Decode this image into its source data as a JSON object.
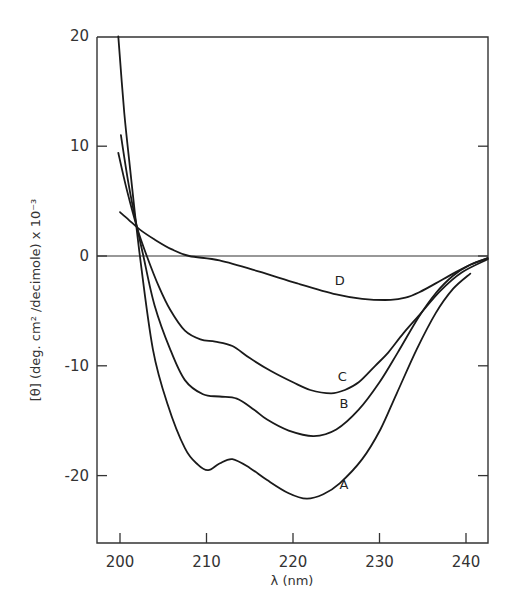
{
  "chart_data": {
    "type": "line",
    "title": "",
    "xlabel": "λ (nm)",
    "ylabel": "[θ] (deg. cm² /decimole) x 10⁻³",
    "xlim": [
      197.3,
      242.5
    ],
    "ylim": [
      -26,
      20
    ],
    "xticks": [
      200,
      210,
      220,
      230,
      240
    ],
    "yticks": [
      20,
      10,
      0,
      -10,
      -20
    ],
    "xtick_labels": [
      "200",
      "210",
      "220",
      "230",
      "240"
    ],
    "ytick_labels": [
      "20",
      "10",
      "0",
      "-10",
      "-20"
    ],
    "grid": false,
    "zero_line": true,
    "legend": "inline labels",
    "series": [
      {
        "name": "A",
        "label_pos": [
          225.9,
          -21.2
        ],
        "x": [
          199.8,
          200.5,
          201.3,
          202.3,
          203.8,
          205.5,
          207.5,
          209.0,
          210.2,
          211.5,
          213.0,
          215.0,
          217.0,
          219.5,
          221.6,
          223.5,
          225.4,
          228.0,
          230.1,
          232.0,
          234.3,
          236.5,
          238.5,
          240.5
        ],
        "y": [
          20.0,
          13.0,
          7.0,
          0.0,
          -8.5,
          -13.5,
          -17.5,
          -19.0,
          -19.5,
          -18.9,
          -18.5,
          -19.3,
          -20.4,
          -21.6,
          -22.1,
          -21.7,
          -20.7,
          -18.5,
          -15.8,
          -12.5,
          -8.5,
          -5.2,
          -3.0,
          -1.6
        ]
      },
      {
        "name": "B",
        "label_pos": [
          225.9,
          -13.8
        ],
        "x": [
          200.1,
          201.0,
          202.0,
          202.7,
          204.0,
          205.8,
          207.5,
          209.6,
          211.5,
          213.5,
          215.5,
          217.0,
          219.5,
          222.4,
          225.0,
          227.6,
          230.0,
          232.1,
          234.5,
          236.5,
          238.5,
          240.5,
          242.5
        ],
        "y": [
          11.0,
          6.5,
          2.5,
          0.0,
          -4.5,
          -8.5,
          -11.3,
          -12.6,
          -12.8,
          -13.0,
          -14.0,
          -14.9,
          -15.9,
          -16.4,
          -15.8,
          -14.0,
          -11.5,
          -8.8,
          -5.6,
          -3.4,
          -1.8,
          -0.8,
          -0.2
        ]
      },
      {
        "name": "C",
        "label_pos": [
          225.7,
          -11.4
        ],
        "x": [
          199.8,
          200.8,
          202.0,
          203.1,
          204.5,
          205.8,
          207.5,
          209.3,
          211.0,
          213.0,
          215.0,
          217.5,
          220.0,
          222.0,
          224.4,
          226.0,
          227.6,
          229.5,
          231.0,
          232.8,
          234.8,
          237.0,
          239.5,
          242.5
        ],
        "y": [
          9.4,
          6.0,
          2.5,
          0.0,
          -2.8,
          -4.9,
          -6.8,
          -7.6,
          -7.8,
          -8.2,
          -9.3,
          -10.5,
          -11.5,
          -12.2,
          -12.5,
          -12.2,
          -11.5,
          -10.0,
          -8.8,
          -7.0,
          -5.2,
          -3.2,
          -1.5,
          -0.3
        ]
      },
      {
        "name": "D",
        "label_pos": [
          225.4,
          -2.6
        ],
        "x": [
          200.0,
          201.0,
          202.3,
          204.0,
          206.0,
          208.0,
          211.5,
          216.0,
          220.5,
          225.0,
          228.0,
          231.3,
          233.0,
          234.6,
          236.5,
          238.5,
          240.5,
          242.5
        ],
        "y": [
          4.0,
          3.3,
          2.4,
          1.5,
          0.6,
          0.0,
          -0.4,
          -1.4,
          -2.5,
          -3.5,
          -3.9,
          -4.0,
          -3.8,
          -3.3,
          -2.5,
          -1.6,
          -0.8,
          -0.2
        ]
      }
    ]
  }
}
